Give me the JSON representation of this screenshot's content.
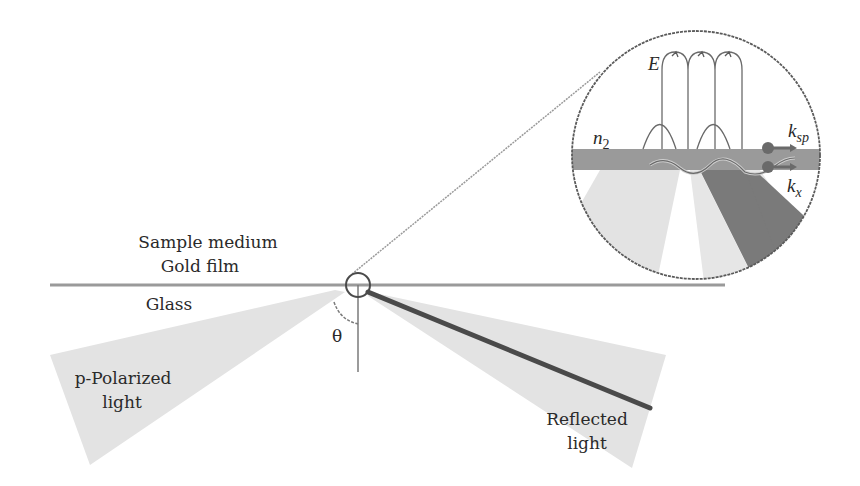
{
  "diagram": {
    "layers": {
      "sample_medium": "Sample medium",
      "gold_film": "Gold film",
      "glass": "Glass"
    },
    "beams": {
      "incident_line1": "p-Polarized",
      "incident_line2": "light",
      "reflected_line1": "Reflected",
      "reflected_line2": "light"
    },
    "angle_label": "θ",
    "inset": {
      "field_label": "E",
      "medium_label": "n",
      "medium_subscript": "2",
      "ksp_label": "k",
      "ksp_subscript": "sp",
      "kx_label": "k",
      "kx_subscript": "x"
    },
    "colors": {
      "line": "#8a8a8a",
      "beam_light": "#e2e2e2",
      "beam_dark": "#7e7e7e",
      "gold_band": "#9a9a9a",
      "reflected_core": "#4a4a4a",
      "outline": "#5a5a5a"
    }
  }
}
